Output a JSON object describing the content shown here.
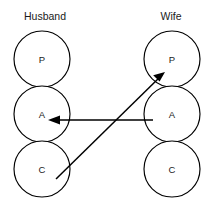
{
  "diagram": {
    "type": "transactional-analysis-pac",
    "width": 214,
    "height": 217,
    "background_color": "#ffffff",
    "line_color": "#000000",
    "text_color": "#1a1a1a",
    "columns": [
      {
        "id": "husband",
        "header": "Husband",
        "header_x": 45,
        "header_y": 20,
        "center_x": 42,
        "states": [
          {
            "id": "husband-parent",
            "label": "P",
            "cx": 42,
            "cy": 59,
            "r": 28
          },
          {
            "id": "husband-adult",
            "label": "A",
            "cx": 42,
            "cy": 114,
            "r": 28
          },
          {
            "id": "husband-child",
            "label": "C",
            "cx": 42,
            "cy": 169,
            "r": 28
          }
        ]
      },
      {
        "id": "wife",
        "header": "Wife",
        "header_x": 171,
        "header_y": 20,
        "center_x": 172,
        "states": [
          {
            "id": "wife-parent",
            "label": "P",
            "cx": 172,
            "cy": 59,
            "r": 28
          },
          {
            "id": "wife-adult",
            "label": "A",
            "cx": 172,
            "cy": 114,
            "r": 28
          },
          {
            "id": "wife-child",
            "label": "C",
            "cx": 172,
            "cy": 169,
            "r": 28
          }
        ]
      }
    ],
    "transactions": [
      {
        "id": "wife-adult-to-husband-adult",
        "from": "wife-adult",
        "to": "husband-adult",
        "x1": 153,
        "y1": 120,
        "x2": 50,
        "y2": 120,
        "arrowhead": "end",
        "style": "solid"
      },
      {
        "id": "husband-child-to-wife-parent",
        "from": "husband-child",
        "to": "wife-parent",
        "x1": 56,
        "y1": 179,
        "x2": 164,
        "y2": 73,
        "arrowhead": "end",
        "style": "solid"
      }
    ]
  }
}
